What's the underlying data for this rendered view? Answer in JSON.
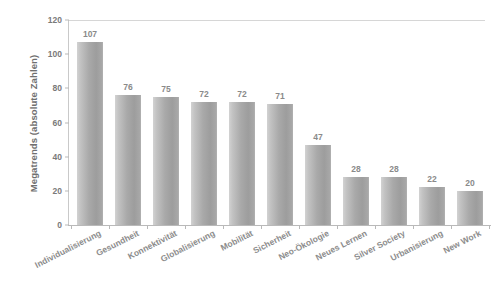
{
  "chart_data": {
    "type": "bar",
    "title": "",
    "subtitle": "",
    "xlabel": "",
    "ylabel": "Megatrends (absolute Zahlen)",
    "ylim": [
      0,
      120
    ],
    "ytick_values": [
      0,
      20,
      40,
      60,
      80,
      100,
      120
    ],
    "ytick_labels": [
      "0",
      "20",
      "40",
      "60",
      "80",
      "100",
      "120"
    ],
    "grid": false,
    "legend": false,
    "legend_position": "none",
    "bar_color": "#a8a8a8",
    "label_color": "#8a8a8a",
    "categories": [
      "Individualisierung",
      "Gesundheit",
      "Konnektivität",
      "Globalisierung",
      "Mobilität",
      "Sicherheit",
      "Neo-Ökologie",
      "Neues Lernen",
      "Silver Society",
      "Urbanisierung",
      "New Work"
    ],
    "values": [
      107,
      76,
      75,
      72,
      72,
      71,
      47,
      28,
      28,
      22,
      20
    ],
    "data_labels": [
      "107",
      "76",
      "75",
      "72",
      "72",
      "71",
      "47",
      "28",
      "28",
      "22",
      "20"
    ]
  }
}
